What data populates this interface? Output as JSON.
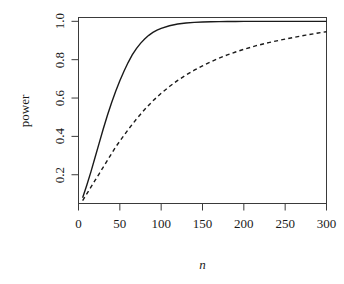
{
  "chart_data": {
    "type": "line",
    "title": "",
    "xlabel": "n",
    "ylabel": "power",
    "xlim": [
      0,
      300
    ],
    "ylim": [
      0.05,
      1.02
    ],
    "grid": false,
    "legend": "none",
    "background_color": "#ffffff",
    "line_color": "#000000",
    "xticks": [
      0,
      50,
      100,
      150,
      200,
      250,
      300
    ],
    "xticklabels": [
      "0",
      "50",
      "100",
      "150",
      "200",
      "250",
      "300"
    ],
    "yticks": [
      0.2,
      0.4,
      0.6,
      0.8,
      1.0
    ],
    "yticklabels": [
      "0.2",
      "0.4",
      "0.6",
      "0.8",
      "1.0"
    ],
    "series": [
      {
        "name": "solid",
        "style": "solid",
        "x": [
          5,
          10,
          15,
          20,
          25,
          30,
          35,
          40,
          45,
          50,
          55,
          60,
          65,
          70,
          75,
          80,
          85,
          90,
          95,
          100,
          110,
          120,
          130,
          140,
          150,
          160,
          170,
          180,
          190,
          200,
          220,
          240,
          260,
          280,
          300
        ],
        "y": [
          0.08,
          0.145,
          0.215,
          0.29,
          0.365,
          0.44,
          0.51,
          0.575,
          0.635,
          0.69,
          0.74,
          0.785,
          0.825,
          0.858,
          0.885,
          0.908,
          0.927,
          0.942,
          0.954,
          0.963,
          0.977,
          0.986,
          0.991,
          0.9945,
          0.9965,
          0.998,
          0.9987,
          0.9992,
          0.9995,
          0.9997,
          0.9999,
          1.0,
          1.0,
          1.0,
          1.0
        ]
      },
      {
        "name": "dashed",
        "style": "dashed",
        "x": [
          5,
          10,
          15,
          20,
          25,
          30,
          35,
          40,
          45,
          50,
          60,
          70,
          80,
          90,
          100,
          110,
          120,
          130,
          140,
          150,
          160,
          170,
          180,
          190,
          200,
          215,
          230,
          245,
          260,
          275,
          290,
          300
        ],
        "y": [
          0.065,
          0.1,
          0.135,
          0.17,
          0.205,
          0.24,
          0.275,
          0.31,
          0.345,
          0.375,
          0.435,
          0.49,
          0.54,
          0.585,
          0.625,
          0.66,
          0.692,
          0.72,
          0.745,
          0.768,
          0.789,
          0.808,
          0.825,
          0.84,
          0.854,
          0.873,
          0.889,
          0.903,
          0.916,
          0.928,
          0.939,
          0.946
        ]
      }
    ]
  }
}
